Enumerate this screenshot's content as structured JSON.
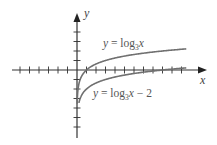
{
  "chart_data": {
    "type": "line",
    "title": "",
    "xlabel": "x",
    "ylabel": "y",
    "xlim": [
      -6.8,
      13.3
    ],
    "ylim": [
      -7.0,
      5.9
    ],
    "x_ticks": [
      -6,
      -5,
      -4,
      -3,
      -2,
      -1,
      1,
      2,
      3,
      4,
      5,
      6,
      7,
      8,
      9,
      10,
      11
    ],
    "y_ticks": [
      -6,
      -5,
      -4,
      -3,
      -2,
      -1,
      1,
      2,
      3,
      4
    ],
    "grid": false,
    "series": [
      {
        "name": "log3x",
        "function": "log3(x)",
        "shift": 0,
        "x_range": [
          0.02,
          11.5
        ],
        "color": "#707070",
        "label_parts": {
          "prefix": "y = log",
          "base": "3",
          "var": "x",
          "suffix": ""
        }
      },
      {
        "name": "log3x-minus-2",
        "function": "log3(x) - 2",
        "shift": -2,
        "x_range": [
          0.2,
          11.5
        ],
        "color": "#707070",
        "label_parts": {
          "prefix": "y = log",
          "base": "3",
          "var": "x",
          "suffix": " − 2"
        }
      }
    ]
  }
}
